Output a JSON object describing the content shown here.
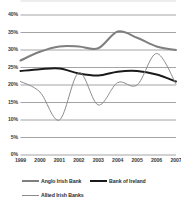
{
  "chart_data": {
    "type": "line",
    "title": "",
    "subtitle": "",
    "xlabel": "",
    "ylabel": "",
    "categories": [
      "1999",
      "2000",
      "2001",
      "2002",
      "2003",
      "2004",
      "2005",
      "2006",
      "2007"
    ],
    "x": [
      1999,
      2000,
      2001,
      2002,
      2003,
      2004,
      2005,
      2006,
      2007
    ],
    "ylim": [
      0,
      40
    ],
    "ytick_values": [
      0,
      5,
      10,
      15,
      20,
      25,
      30,
      35,
      40
    ],
    "ytick_labels": [
      "0%",
      "5%",
      "10%",
      "15%",
      "20%",
      "25%",
      "30%",
      "35%",
      "40%"
    ],
    "grid": true,
    "grid_axis": "y",
    "legend_position": "bottom",
    "value_unit": "%",
    "series": [
      {
        "name": "Anglo Irish Bank",
        "color": "#7f7f7f",
        "width": 2.0,
        "values": [
          27.0,
          29.5,
          31.0,
          31.0,
          30.5,
          35.3,
          33.5,
          31.0,
          30.0
        ]
      },
      {
        "name": "Bank of Ireland",
        "color": "#1a1a1a",
        "width": 2.0,
        "values": [
          24.0,
          24.5,
          24.7,
          23.3,
          22.7,
          23.8,
          24.0,
          23.0,
          21.0
        ]
      },
      {
        "name": "Allied Irish Banks",
        "color": "#8c8c8c",
        "width": 1.0,
        "values": [
          21.0,
          18.0,
          10.0,
          23.5,
          14.3,
          20.7,
          20.0,
          29.0,
          20.3
        ]
      }
    ]
  },
  "legend": {
    "items": [
      {
        "label": "Anglo Irish Bank"
      },
      {
        "label": "Bank of Ireland"
      },
      {
        "label": "Allied Irish Banks"
      }
    ]
  },
  "axis": {
    "y_labels": [
      "40%",
      "35%",
      "30%",
      "25%",
      "20%",
      "15%",
      "10%",
      "5%",
      "0%"
    ],
    "x_labels": [
      "1999",
      "2000",
      "2001",
      "2002",
      "2003",
      "2004",
      "2005",
      "2006",
      "2007"
    ]
  },
  "colors": {
    "grid": "#9a9a9a",
    "anglo": "#7f7f7f",
    "boi": "#1a1a1a",
    "aib": "#8c8c8c",
    "text": "#2b2b2b"
  }
}
